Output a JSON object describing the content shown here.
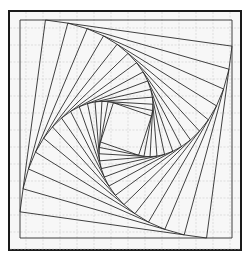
{
  "figure": {
    "frame": {
      "x": 9,
      "y": 11,
      "width": 232,
      "height": 239
    },
    "outer_square": [
      [
        20,
        20
      ],
      [
        232,
        20
      ],
      [
        232,
        238
      ],
      [
        20,
        238
      ]
    ],
    "grid": {
      "spacing": 17,
      "color": "#cfcfcf"
    },
    "line_color": "#2b2b2b",
    "step_ratio": 0.12,
    "num_squares": 15
  }
}
